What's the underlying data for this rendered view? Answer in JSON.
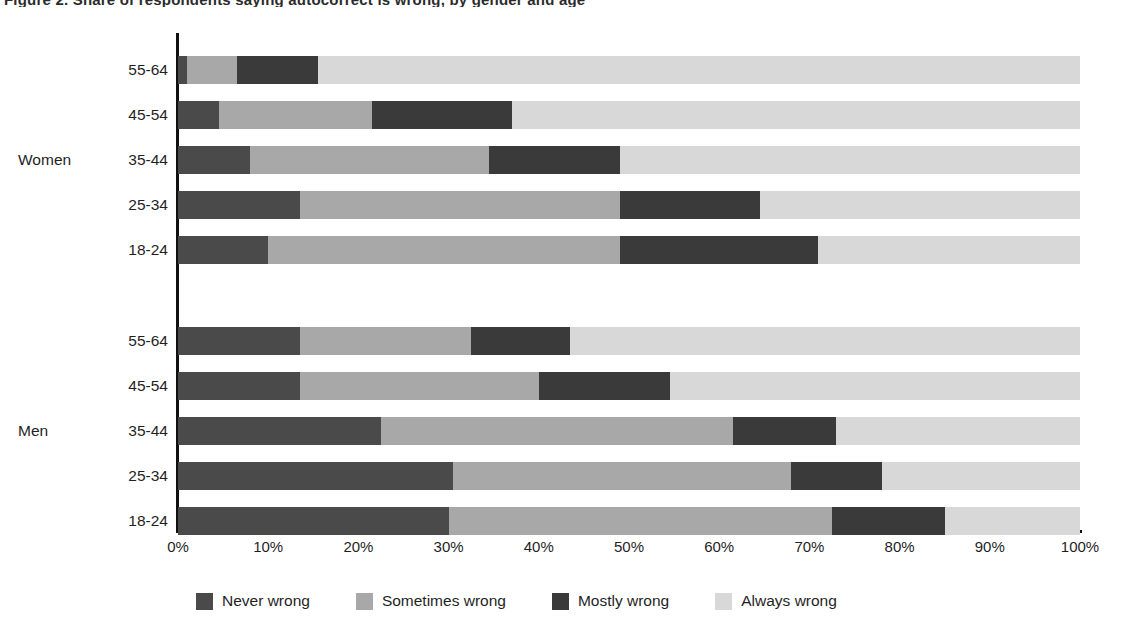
{
  "title": "Figure 2. Share of respondents saying autocorrect is wrong, by gender and age",
  "chart_data": {
    "type": "bar",
    "orientation": "horizontal",
    "stacked": true,
    "stack_mode": "percent",
    "title": "Figure 2. Share of respondents saying autocorrect is wrong, by gender and age",
    "xlabel": "",
    "ylabel": "",
    "xlim": [
      0,
      100
    ],
    "xticks": [
      "0%",
      "10%",
      "20%",
      "30%",
      "40%",
      "50%",
      "60%",
      "70%",
      "80%",
      "90%",
      "100%"
    ],
    "xtick_values": [
      0,
      10,
      20,
      30,
      40,
      50,
      60,
      70,
      80,
      90,
      100
    ],
    "grid": false,
    "legend_position": "bottom",
    "series": [
      {
        "name": "Never wrong",
        "color": "#4a4a4a"
      },
      {
        "name": "Sometimes wrong",
        "color": "#a8a8a8"
      },
      {
        "name": "Mostly wrong",
        "color": "#3a3a3a"
      },
      {
        "name": "Always wrong",
        "color": "#d8d8d8"
      }
    ],
    "groups": [
      {
        "name": "Women",
        "categories": [
          "55-64",
          "45-54",
          "35-44",
          "25-34",
          "18-24"
        ],
        "rows": [
          {
            "category": "55-64",
            "values": [
              1,
              5.5,
              9,
              84.5
            ]
          },
          {
            "category": "45-54",
            "values": [
              4.5,
              17,
              15.5,
              63
            ]
          },
          {
            "category": "35-44",
            "values": [
              8,
              26.5,
              14.5,
              51
            ]
          },
          {
            "category": "25-34",
            "values": [
              13.5,
              35.5,
              15.5,
              35.5
            ]
          },
          {
            "category": "18-24",
            "values": [
              10,
              39,
              22,
              29
            ]
          }
        ]
      },
      {
        "name": "Men",
        "categories": [
          "55-64",
          "45-54",
          "35-44",
          "25-34",
          "18-24"
        ],
        "rows": [
          {
            "category": "55-64",
            "values": [
              13.5,
              19,
              11,
              56.5
            ]
          },
          {
            "category": "45-54",
            "values": [
              13.5,
              26.5,
              14.5,
              45.5
            ]
          },
          {
            "category": "35-44",
            "values": [
              22.5,
              39,
              11.5,
              27
            ]
          },
          {
            "category": "25-34",
            "values": [
              30.5,
              37.5,
              10,
              22
            ]
          },
          {
            "category": "18-24",
            "values": [
              30,
              42.5,
              12.5,
              15
            ]
          }
        ]
      }
    ]
  },
  "legend": [
    {
      "label": "Never wrong",
      "color": "#4a4a4a"
    },
    {
      "label": "Sometimes wrong",
      "color": "#a8a8a8"
    },
    {
      "label": "Mostly wrong",
      "color": "#3a3a3a"
    },
    {
      "label": "Always wrong",
      "color": "#d8d8d8"
    }
  ]
}
